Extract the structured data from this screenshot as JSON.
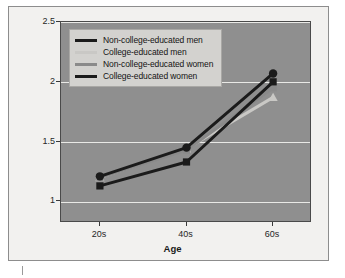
{
  "figure": {
    "background_color": "#ffffff",
    "panel_color": "#8f8f8f",
    "grid_color": "#e9e9e6",
    "legend_background": "#d3d2cf"
  },
  "axes": {
    "ylabel": "Mean Concern-About-Aging Rating",
    "xlabel": "Age",
    "yticks": [
      "1",
      "1.5",
      "2",
      "2.5"
    ],
    "xticks": [
      "20s",
      "40s",
      "60s"
    ]
  },
  "legend": {
    "items": [
      {
        "label": "Non-college-educated men",
        "color": "#1b1b1b"
      },
      {
        "label": "College-educated men",
        "color": "#c9c8c5"
      },
      {
        "label": "Non-college-educated women",
        "color": "#8a8a8a"
      },
      {
        "label": "College-educated women",
        "color": "#1b1b1b"
      }
    ]
  },
  "caption": {
    "fragment": ""
  },
  "chart_data": {
    "type": "line",
    "title": "",
    "xlabel": "Age",
    "ylabel": "Mean Concern-About-Aging Rating",
    "categories": [
      "20s",
      "40s",
      "60s"
    ],
    "ylim": [
      0.82,
      2.5
    ],
    "yticks": [
      1,
      1.5,
      2,
      2.5
    ],
    "grid": true,
    "legend_position": "upper-left",
    "series": [
      {
        "name": "Non-college-educated men",
        "color": "#1b1b1b",
        "marker": "square",
        "values": [
          1.13,
          1.33,
          2.0
        ]
      },
      {
        "name": "College-educated men",
        "color": "#c9c8c5",
        "marker": "triangle",
        "values": [
          1.2,
          1.44,
          1.87
        ]
      },
      {
        "name": "Non-college-educated women",
        "color": "#8a8a8a",
        "marker": "square",
        "values": [
          1.2,
          1.43,
          1.95
        ]
      },
      {
        "name": "College-educated women",
        "color": "#1b1b1b",
        "marker": "circle",
        "values": [
          1.21,
          1.45,
          2.07
        ]
      }
    ]
  }
}
